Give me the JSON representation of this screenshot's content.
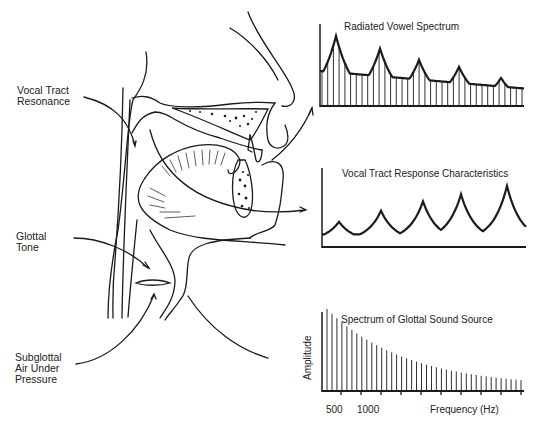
{
  "labels": {
    "vocal_tract_resonance": [
      "Vocal Tract",
      "Resonance"
    ],
    "glottal_tone": [
      "Glottal",
      "Tone"
    ],
    "subglottal_air": [
      "Subglottal",
      "Air Under",
      "Pressure"
    ]
  },
  "chart_data": [
    {
      "type": "bar",
      "title": "Radiated Vowel Spectrum",
      "xlabel": "",
      "ylabel": "",
      "description": "Harmonic lines under an envelope with 5 formant peaks decreasing in height",
      "envelope_peaks_relative": [
        1.0,
        0.82,
        0.66,
        0.56,
        0.4
      ],
      "harmonic_count": 36
    },
    {
      "type": "line",
      "title": "Vocal Tract Response Characteristics",
      "xlabel": "",
      "ylabel": "",
      "description": "Resonance curve with 5 peaks increasing in height",
      "peaks_relative": [
        0.35,
        0.55,
        0.72,
        0.85,
        1.0
      ]
    },
    {
      "type": "bar",
      "title": "Spectrum of Glottal Sound Source",
      "xlabel": "Frequency (Hz)",
      "ylabel": "Amplitude",
      "x_tick_labels": [
        "500",
        "1000"
      ],
      "description": "Harmonic lines with monotonically decreasing amplitude",
      "harmonic_count": 40
    }
  ],
  "charts": {
    "radiated": {
      "title": "Radiated Vowel Spectrum"
    },
    "response": {
      "title": "Vocal Tract Response Characteristics"
    },
    "glottal": {
      "title": "Spectrum of Glottal Sound Source",
      "ylabel": "Amplitude",
      "xlabel": "Frequency (Hz)",
      "tick1": "500",
      "tick2": "1000"
    }
  }
}
